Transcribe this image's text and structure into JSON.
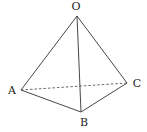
{
  "diagram": {
    "type": "tetrahedron",
    "vertices": {
      "O": {
        "label": "O",
        "x": 77,
        "y": 16,
        "lx": 76,
        "ly": 10
      },
      "A": {
        "label": "A",
        "x": 21,
        "y": 90,
        "lx": 12,
        "ly": 94
      },
      "B": {
        "label": "B",
        "x": 81,
        "y": 112,
        "lx": 84,
        "ly": 126
      },
      "C": {
        "label": "C",
        "x": 127,
        "y": 83,
        "lx": 136,
        "ly": 87
      }
    },
    "edges": [
      {
        "from": "O",
        "to": "A",
        "style": "solid"
      },
      {
        "from": "O",
        "to": "B",
        "style": "solid"
      },
      {
        "from": "O",
        "to": "C",
        "style": "solid"
      },
      {
        "from": "A",
        "to": "B",
        "style": "solid"
      },
      {
        "from": "B",
        "to": "C",
        "style": "solid"
      },
      {
        "from": "A",
        "to": "C",
        "style": "dashed"
      }
    ],
    "colors": {
      "line": "#333333",
      "text": "#222222",
      "background": "#ffffff"
    }
  }
}
